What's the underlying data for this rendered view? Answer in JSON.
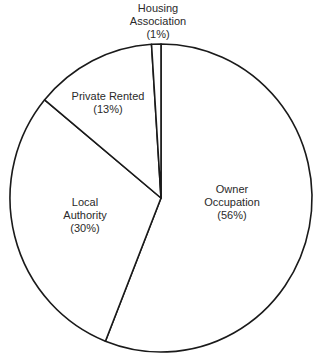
{
  "chart_data": {
    "type": "pie",
    "title": "",
    "start_angle_deg": 0,
    "direction": "clockwise",
    "slices": [
      {
        "name": "Owner Occupation",
        "label_lines": [
          "Owner",
          "Occupation",
          "(56%)"
        ],
        "value": 56
      },
      {
        "name": "Local Authority",
        "label_lines": [
          "Local",
          "Authority",
          "(30%)"
        ],
        "value": 30
      },
      {
        "name": "Private Rented",
        "label_lines": [
          "Private Rented",
          "(13%)"
        ],
        "value": 13
      },
      {
        "name": "Housing Association",
        "label_lines": [
          "Housing",
          "Association",
          "(1%)"
        ],
        "value": 1
      }
    ],
    "legend": "none (labels inside/outside slices)",
    "stroke_color": "#1a1a1a",
    "fill_color": "#ffffff"
  },
  "labels": {
    "owner": {
      "l1": "Owner",
      "l2": "Occupation",
      "l3": "(56%)"
    },
    "local": {
      "l1": "Local",
      "l2": "Authority",
      "l3": "(30%)"
    },
    "private": {
      "l1": "Private Rented",
      "l2": "(13%)"
    },
    "housing": {
      "l1": "Housing",
      "l2": "Association",
      "l3": "(1%)"
    }
  }
}
